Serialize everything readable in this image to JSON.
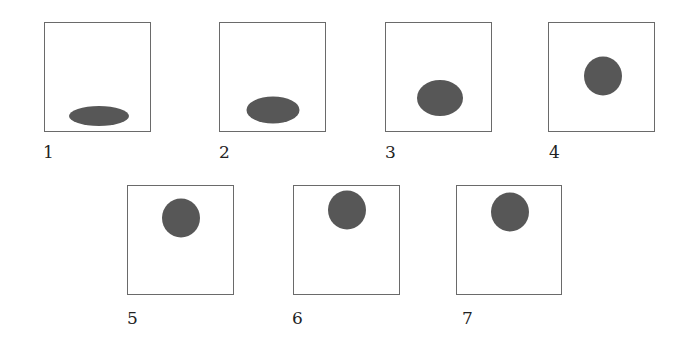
{
  "figure": {
    "colors": {
      "blob_fill": "#575757",
      "frame_border": "#6a6a6a",
      "label_text": "#222222",
      "background": "#ffffff"
    },
    "panels": [
      {
        "label": "1",
        "frame": {
          "x": 44,
          "y": 22,
          "w": 107,
          "h": 110
        },
        "blob": {
          "cx": 54,
          "cy": 93,
          "w": 60,
          "h": 20
        },
        "label_pos": {
          "x": 43,
          "y": 143
        }
      },
      {
        "label": "2",
        "frame": {
          "x": 219,
          "y": 22,
          "w": 107,
          "h": 110
        },
        "blob": {
          "cx": 53,
          "cy": 87,
          "w": 53,
          "h": 27
        },
        "label_pos": {
          "x": 219,
          "y": 143
        }
      },
      {
        "label": "3",
        "frame": {
          "x": 385,
          "y": 22,
          "w": 107,
          "h": 110
        },
        "blob": {
          "cx": 54,
          "cy": 75,
          "w": 46,
          "h": 36
        },
        "label_pos": {
          "x": 385,
          "y": 143
        }
      },
      {
        "label": "4",
        "frame": {
          "x": 548,
          "y": 22,
          "w": 107,
          "h": 110
        },
        "blob": {
          "cx": 54,
          "cy": 53,
          "w": 38,
          "h": 39
        },
        "label_pos": {
          "x": 549,
          "y": 143
        }
      },
      {
        "label": "5",
        "frame": {
          "x": 127,
          "y": 185,
          "w": 107,
          "h": 110
        },
        "blob": {
          "cx": 53,
          "cy": 32,
          "w": 38,
          "h": 39
        },
        "label_pos": {
          "x": 127,
          "y": 309
        }
      },
      {
        "label": "6",
        "frame": {
          "x": 293,
          "y": 185,
          "w": 107,
          "h": 110
        },
        "blob": {
          "cx": 53,
          "cy": 24,
          "w": 38,
          "h": 39
        },
        "label_pos": {
          "x": 292,
          "y": 309
        }
      },
      {
        "label": "7",
        "frame": {
          "x": 456,
          "y": 185,
          "w": 106,
          "h": 110
        },
        "blob": {
          "cx": 53,
          "cy": 26,
          "w": 38,
          "h": 39
        },
        "label_pos": {
          "x": 462,
          "y": 309
        }
      }
    ]
  }
}
